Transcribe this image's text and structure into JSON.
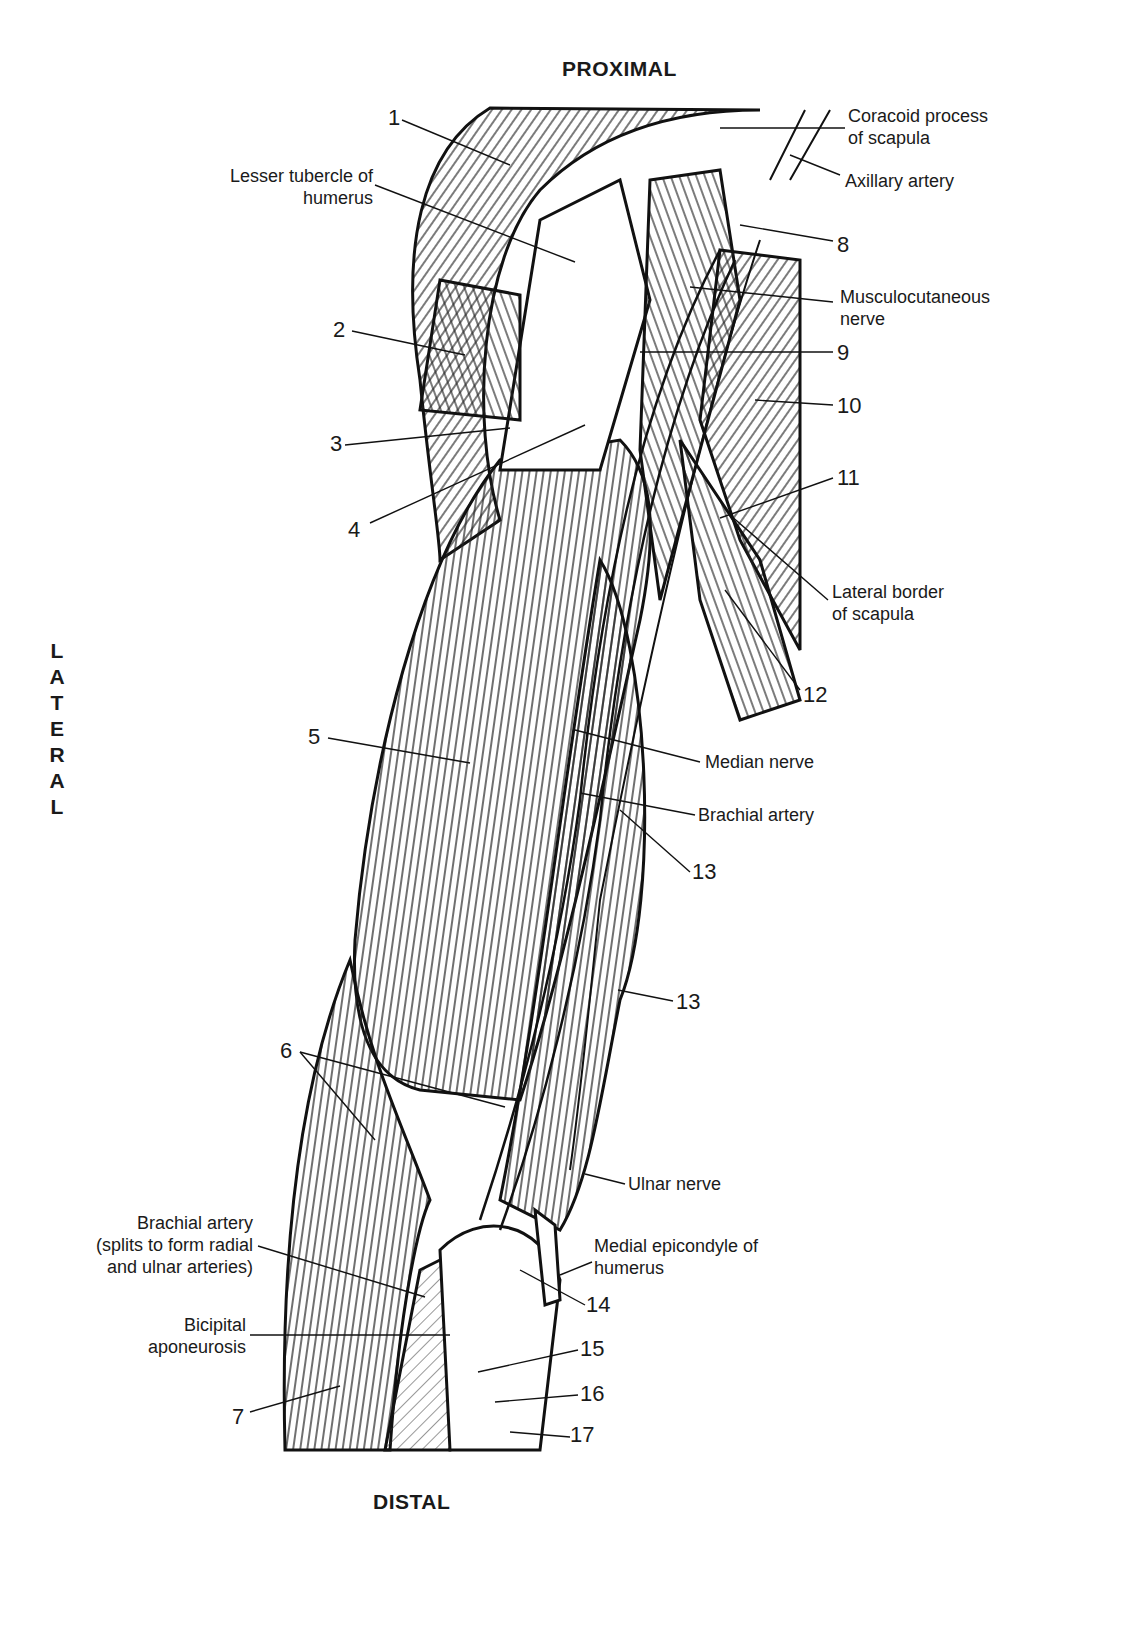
{
  "orientation": {
    "top": "PROXIMAL",
    "bottom": "DISTAL",
    "side": [
      "L",
      "A",
      "T",
      "E",
      "R",
      "A",
      "L"
    ]
  },
  "numbers": [
    "1",
    "2",
    "3",
    "4",
    "5",
    "6",
    "7",
    "8",
    "9",
    "10",
    "11",
    "12",
    "13",
    "13",
    "14",
    "15",
    "16",
    "17"
  ],
  "labels": {
    "coracoid_1": "Coracoid process",
    "coracoid_2": "of scapula",
    "axillary": "Axillary artery",
    "lesser_1": "Lesser tubercle of",
    "lesser_2": "humerus",
    "musculo_1": "Musculocutaneous",
    "musculo_2": "nerve",
    "lateral_border_1": "Lateral border",
    "lateral_border_2": "of scapula",
    "median_nerve": "Median nerve",
    "brachial_artery": "Brachial artery",
    "ulnar_nerve": "Ulnar nerve",
    "medial_epi_1": "Medial epicondyle of",
    "medial_epi_2": "humerus",
    "brachial_split_1": "Brachial artery",
    "brachial_split_2": "(splits to form radial",
    "brachial_split_3": "and ulnar arteries)",
    "bicipital_1": "Bicipital",
    "bicipital_2": "aponeurosis"
  }
}
